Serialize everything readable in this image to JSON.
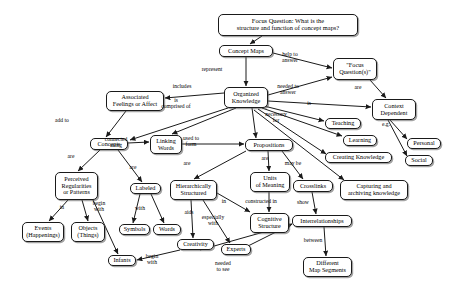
{
  "diagram": {
    "type": "concept-map",
    "stroke_color": "#1a1a1a",
    "node_fill": "#ffffff",
    "text_color": "#000000",
    "nodes": [
      {
        "id": "focus_question",
        "label": "Focus Question: What is the\nstructure and function of concept maps?",
        "x": 218,
        "y": 14,
        "w": 140,
        "h": 22
      },
      {
        "id": "concept_maps",
        "label": "Concept Maps",
        "x": 219,
        "y": 45,
        "w": 54,
        "h": 12
      },
      {
        "id": "focus_questions",
        "label": "\"Focus\nQuestion(s)\"",
        "x": 333,
        "y": 58,
        "w": 44,
        "h": 22
      },
      {
        "id": "organized_knowledge",
        "label": "Organized\nKnowledge",
        "x": 224,
        "y": 87,
        "w": 44,
        "h": 21
      },
      {
        "id": "associated_feelings",
        "label": "Associated\nFeelings or Affect",
        "x": 106,
        "y": 91,
        "w": 58,
        "h": 20
      },
      {
        "id": "context_dependent",
        "label": "Context\nDependent",
        "x": 372,
        "y": 99,
        "w": 44,
        "h": 21
      },
      {
        "id": "teaching",
        "label": "Teaching",
        "x": 325,
        "y": 118,
        "w": 36,
        "h": 11
      },
      {
        "id": "learning",
        "label": "Learning",
        "x": 343,
        "y": 135,
        "w": 34,
        "h": 11
      },
      {
        "id": "personal",
        "label": "Personal",
        "x": 407,
        "y": 138,
        "w": 34,
        "h": 11
      },
      {
        "id": "concepts",
        "label": "Concepts",
        "x": 90,
        "y": 138,
        "w": 38,
        "h": 12
      },
      {
        "id": "linking_words",
        "label": "Linking\nWords",
        "x": 150,
        "y": 135,
        "w": 32,
        "h": 19
      },
      {
        "id": "propositions",
        "label": "Propositions",
        "x": 245,
        "y": 139,
        "w": 48,
        "h": 12
      },
      {
        "id": "creating_knowledge",
        "label": "Creating Knowledge",
        "x": 325,
        "y": 152,
        "w": 67,
        "h": 11
      },
      {
        "id": "social",
        "label": "Social",
        "x": 405,
        "y": 155,
        "w": 28,
        "h": 11
      },
      {
        "id": "units_of_meaning",
        "label": "Units\nof Meaning",
        "x": 250,
        "y": 172,
        "w": 40,
        "h": 20
      },
      {
        "id": "crosslinks",
        "label": "Crosslinks",
        "x": 293,
        "y": 180,
        "w": 40,
        "h": 12
      },
      {
        "id": "capturing",
        "label": "Capturing and\narchiving knowledge",
        "x": 340,
        "y": 180,
        "w": 68,
        "h": 20
      },
      {
        "id": "perceived_regularities",
        "label": "Perceived\nRegularities\nor Patterns",
        "x": 55,
        "y": 172,
        "w": 43,
        "h": 28
      },
      {
        "id": "labeled",
        "label": "Labeled",
        "x": 130,
        "y": 183,
        "w": 31,
        "h": 11
      },
      {
        "id": "hierarchically",
        "label": "Hierarchically\nStructured",
        "x": 170,
        "y": 180,
        "w": 47,
        "h": 20
      },
      {
        "id": "cognitive_structure",
        "label": "Cognitive\nStructure",
        "x": 250,
        "y": 213,
        "w": 39,
        "h": 20
      },
      {
        "id": "interrelationships",
        "label": "Interrelationships",
        "x": 292,
        "y": 215,
        "w": 60,
        "h": 12
      },
      {
        "id": "symbols",
        "label": "Symbols",
        "x": 119,
        "y": 224,
        "w": 31,
        "h": 11
      },
      {
        "id": "words",
        "label": "Words",
        "x": 153,
        "y": 224,
        "w": 28,
        "h": 11
      },
      {
        "id": "events",
        "label": "Events\n(Happenings)",
        "x": 22,
        "y": 222,
        "w": 42,
        "h": 20
      },
      {
        "id": "objects",
        "label": "Objects\n(Things)",
        "x": 71,
        "y": 222,
        "w": 34,
        "h": 20
      },
      {
        "id": "creativity",
        "label": "Creativity",
        "x": 177,
        "y": 239,
        "w": 37,
        "h": 11
      },
      {
        "id": "experts",
        "label": "Experts",
        "x": 221,
        "y": 244,
        "w": 30,
        "h": 11
      },
      {
        "id": "infants",
        "label": "Infants",
        "x": 108,
        "y": 255,
        "w": 28,
        "h": 11
      },
      {
        "id": "different_map_segments",
        "label": "Different\nMap Segments",
        "x": 303,
        "y": 257,
        "w": 49,
        "h": 20
      }
    ],
    "link_labels": [
      {
        "id": "represent",
        "label": "represent",
        "x": 212,
        "y": 67
      },
      {
        "id": "help_to_answer",
        "label": "help to\nanswer",
        "x": 290,
        "y": 55
      },
      {
        "id": "includes",
        "label": "includes",
        "x": 180,
        "y": 87
      },
      {
        "id": "needed_to_answer",
        "label": "needed to\nanswer",
        "x": 282,
        "y": 87
      },
      {
        "id": "is",
        "label": "is",
        "x": 310,
        "y": 104
      },
      {
        "id": "are_ctx",
        "label": "are",
        "x": 357,
        "y": 88
      },
      {
        "id": "is_comprised_of",
        "label": "is\ncomprised of",
        "x": 176,
        "y": 101
      },
      {
        "id": "necessary_for",
        "label": "necessary\nfor",
        "x": 275,
        "y": 115
      },
      {
        "id": "eg",
        "label": "e.g.",
        "x": 385,
        "y": 124
      },
      {
        "id": "add_to",
        "label": "add to",
        "x": 62,
        "y": 121
      },
      {
        "id": "connected_using",
        "label": "connected\nusing",
        "x": 115,
        "y": 140
      },
      {
        "id": "used_to_form",
        "label": "used to\nform",
        "x": 190,
        "y": 139
      },
      {
        "id": "are_props",
        "label": "are",
        "x": 264,
        "y": 158
      },
      {
        "id": "may_be",
        "label": "may be",
        "x": 292,
        "y": 163
      },
      {
        "id": "are_concepts",
        "label": "are",
        "x": 70,
        "y": 156
      },
      {
        "id": "are_labeled",
        "label": "are",
        "x": 132,
        "y": 167
      },
      {
        "id": "are_hier",
        "label": "are",
        "x": 186,
        "y": 163
      },
      {
        "id": "in_regul",
        "label": "in",
        "x": 61,
        "y": 207
      },
      {
        "id": "begin_with_1",
        "label": "begin\nwith",
        "x": 96,
        "y": 204
      },
      {
        "id": "with_labeled",
        "label": "with",
        "x": 138,
        "y": 208
      },
      {
        "id": "aids",
        "label": "aids",
        "x": 188,
        "y": 212
      },
      {
        "id": "especially_with",
        "label": "especially\nwith",
        "x": 208,
        "y": 218
      },
      {
        "id": "in_cog",
        "label": "in",
        "x": 222,
        "y": 202
      },
      {
        "id": "constructed_in",
        "label": "constructed in",
        "x": 261,
        "y": 201
      },
      {
        "id": "show",
        "label": "show",
        "x": 301,
        "y": 202
      },
      {
        "id": "between",
        "label": "between",
        "x": 312,
        "y": 240
      },
      {
        "id": "needed_to_see",
        "label": "needed\nto see",
        "x": 222,
        "y": 264
      },
      {
        "id": "begin_with_2",
        "label": "begin\nwith",
        "x": 147,
        "y": 256
      }
    ],
    "edges": [
      "focus_question -> concept_maps",
      "concept_maps -> organized_knowledge (represent)",
      "concept_maps -> focus_questions (help to answer)",
      "organized_knowledge -> focus_questions (needed to answer)",
      "organized_knowledge -> associated_feelings (includes)",
      "organized_knowledge -> context_dependent (is)",
      "focus_questions -> context_dependent (are)",
      "organized_knowledge -> concepts (is comprised of)",
      "organized_knowledge -> linking_words (is comprised of)",
      "organized_knowledge -> propositions (is comprised of)",
      "organized_knowledge -> teaching (necessary for)",
      "organized_knowledge -> learning (necessary for)",
      "organized_knowledge -> creating_knowledge (necessary for)",
      "organized_knowledge -> capturing (necessary for)",
      "context_dependent -> personal (e.g.)",
      "context_dependent -> social (e.g.)",
      "associated_feelings -> concepts (add to)",
      "concepts -> linking_words (connected using)",
      "linking_words -> propositions (used to form)",
      "propositions -> units_of_meaning (are)",
      "propositions -> crosslinks (may be)",
      "propositions -> hierarchically (are)",
      "concepts -> perceived_regularities (are)",
      "concepts -> labeled (are)",
      "perceived_regularities -> events (in)",
      "perceived_regularities -> objects (in)",
      "perceived_regularities -> infants (begin with)",
      "labeled -> symbols (with)",
      "labeled -> words (with)",
      "hierarchically -> creativity (aids)",
      "hierarchically -> experts (especially with)",
      "hierarchically -> cognitive_structure (in)",
      "units_of_meaning -> cognitive_structure (constructed in)",
      "crosslinks -> interrelationships (show)",
      "interrelationships -> different_map_segments (between)",
      "creativity -> infants (begin with)",
      "creativity -> interrelationships (needed to see)",
      "experts -> interrelationships (needed to see)"
    ]
  }
}
